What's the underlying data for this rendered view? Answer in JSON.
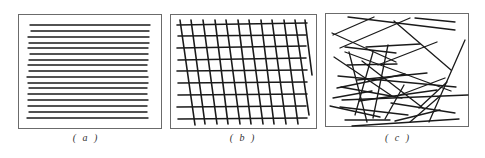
{
  "colors": {
    "frame": "#6b6b6b",
    "line": "#1a1a1a",
    "background": "#ffffff",
    "caption": "#333333"
  },
  "panels": [
    {
      "id": "a",
      "caption": "( a )",
      "caption_x": 86,
      "frame": {
        "x": 18,
        "y": 14,
        "w": 143,
        "h": 114
      },
      "line_width": 1.4,
      "lines": [
        [
          30,
          25,
          150,
          25
        ],
        [
          31,
          31,
          149,
          31
        ],
        [
          28,
          37,
          149,
          37
        ],
        [
          29,
          43,
          149,
          43
        ],
        [
          28,
          48,
          148,
          48
        ],
        [
          30,
          54,
          148,
          54
        ],
        [
          29,
          60,
          148,
          60
        ],
        [
          28,
          65,
          147,
          65
        ],
        [
          29,
          71,
          147,
          71
        ],
        [
          27,
          77,
          148,
          77
        ],
        [
          28,
          83,
          148,
          83
        ],
        [
          29,
          88,
          147,
          88
        ],
        [
          28,
          94,
          147,
          94
        ],
        [
          28,
          100,
          148,
          100
        ],
        [
          28,
          106,
          147,
          106
        ],
        [
          29,
          112,
          147,
          112
        ],
        [
          27,
          118,
          148,
          118
        ]
      ]
    },
    {
      "id": "b",
      "caption": "( b )",
      "caption_x": 243,
      "frame": {
        "x": 170,
        "y": 14,
        "w": 146,
        "h": 114
      },
      "line_width": 1.6,
      "lines": [
        [
          177,
          25,
          307,
          23
        ],
        [
          178,
          36,
          306,
          35
        ],
        [
          177,
          48,
          306,
          46
        ],
        [
          178,
          60,
          306,
          58
        ],
        [
          177,
          71,
          307,
          70
        ],
        [
          178,
          83,
          307,
          82
        ],
        [
          178,
          95,
          307,
          94
        ],
        [
          177,
          107,
          306,
          106
        ],
        [
          178,
          119,
          307,
          118
        ],
        [
          180,
          20,
          195,
          125
        ],
        [
          191,
          20,
          205,
          124
        ],
        [
          203,
          20,
          217,
          124
        ],
        [
          215,
          20,
          228,
          124
        ],
        [
          226,
          20,
          240,
          124
        ],
        [
          238,
          20,
          251,
          124
        ],
        [
          249,
          20,
          263,
          124
        ],
        [
          261,
          20,
          274,
          124
        ],
        [
          272,
          20,
          286,
          124
        ],
        [
          284,
          20,
          298,
          124
        ],
        [
          295,
          20,
          309,
          115
        ],
        [
          305,
          20,
          312,
          75
        ]
      ]
    },
    {
      "id": "c",
      "caption": "( c )",
      "caption_x": 398,
      "frame": {
        "x": 325,
        "y": 13,
        "w": 143,
        "h": 113
      },
      "line_width": 1.3,
      "lines": [
        [
          348,
          17,
          455,
          30
        ],
        [
          415,
          18,
          455,
          22
        ],
        [
          333,
          35,
          374,
          17
        ],
        [
          340,
          48,
          410,
          18
        ],
        [
          332,
          33,
          396,
          62
        ],
        [
          394,
          21,
          451,
          70
        ],
        [
          345,
          47,
          396,
          53
        ],
        [
          366,
          47,
          420,
          44
        ],
        [
          378,
          65,
          437,
          42
        ],
        [
          349,
          52,
          367,
          122
        ],
        [
          373,
          52,
          355,
          115
        ],
        [
          388,
          45,
          373,
          118
        ],
        [
          334,
          57,
          392,
          96
        ],
        [
          345,
          52,
          451,
          91
        ],
        [
          362,
          61,
          423,
          108
        ],
        [
          338,
          76,
          456,
          87
        ],
        [
          357,
          80,
          427,
          73
        ],
        [
          341,
          87,
          402,
          98
        ],
        [
          342,
          100,
          468,
          95
        ],
        [
          337,
          88,
          405,
          74
        ],
        [
          330,
          106,
          380,
          117
        ],
        [
          359,
          101,
          437,
          90
        ],
        [
          340,
          107,
          408,
          115
        ],
        [
          345,
          120,
          390,
          120
        ],
        [
          400,
          95,
          445,
          78
        ],
        [
          395,
          121,
          440,
          110
        ],
        [
          352,
          126,
          459,
          119
        ],
        [
          385,
          119,
          404,
          85
        ],
        [
          410,
          122,
          440,
          96
        ],
        [
          429,
          122,
          465,
          40
        ],
        [
          419,
          108,
          447,
          82
        ],
        [
          391,
          103,
          455,
          113
        ],
        [
          347,
          65,
          397,
          64
        ],
        [
          333,
          98,
          372,
          91
        ]
      ]
    }
  ]
}
